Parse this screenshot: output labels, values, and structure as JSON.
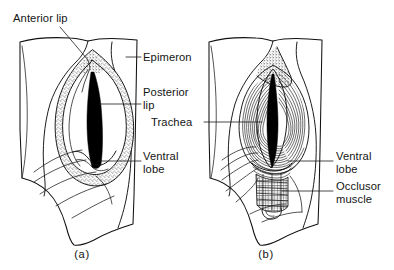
{
  "figure": {
    "background_color": "#ffffff",
    "ink_color": "#111111",
    "panels": [
      {
        "caption": "(a)",
        "caption_x": 82,
        "caption_y": 258,
        "description": "spiracle with stippled anterior and posterior lips"
      },
      {
        "caption": "(b)",
        "caption_x": 266,
        "caption_y": 258,
        "description": "spiracle with concentric striations, ventral lobe and occlusor muscle"
      }
    ]
  },
  "labels": [
    {
      "id": "anterior-lip",
      "text": "Anterior lip",
      "text_x": 13,
      "text_y": 22,
      "anchor": "start",
      "leader": "M 88 27 L 110 47 L 112 52 L 96 72 L 86 84"
    },
    {
      "id": "epimeron",
      "text": "Epimeron",
      "text_x": 143,
      "text_y": 61,
      "anchor": "start",
      "leader": "M 126 57 L 141 57"
    },
    {
      "id": "posterior-lip",
      "text": "Posterior",
      "text_x": 143,
      "text_y": 95,
      "anchor": "start",
      "leader": "M 99 104 L 141 104"
    },
    {
      "id": "posterior-lip-line2",
      "text": "lip",
      "text_x": 143,
      "text_y": 108,
      "anchor": "start",
      "leader": ""
    },
    {
      "id": "trachea",
      "text": "Trachea",
      "text_x": 151,
      "text_y": 124,
      "anchor": "start",
      "leader": "M 204 122 L 262 122"
    },
    {
      "id": "ventral-lobe-a",
      "text": "Ventral",
      "text_x": 143,
      "text_y": 155,
      "anchor": "start",
      "leader": "M 98 161 L 141 161"
    },
    {
      "id": "ventral-lobe-a-line2",
      "text": "lobe",
      "text_x": 143,
      "text_y": 169,
      "anchor": "start",
      "leader": ""
    },
    {
      "id": "ventral-lobe-b",
      "text": "Ventral",
      "text_x": 336,
      "text_y": 155,
      "anchor": "start",
      "leader": "M 290 161 L 333 161"
    },
    {
      "id": "ventral-lobe-b-line2",
      "text": "lobe",
      "text_x": 336,
      "text_y": 169,
      "anchor": "start",
      "leader": ""
    },
    {
      "id": "occlusor-muscle",
      "text": "Occlusor",
      "text_x": 336,
      "text_y": 186,
      "anchor": "start",
      "leader": "M 282 191 L 333 191"
    },
    {
      "id": "occlusor-muscle-line2",
      "text": "muscle",
      "text_x": 336,
      "text_y": 200,
      "anchor": "start",
      "leader": ""
    }
  ]
}
